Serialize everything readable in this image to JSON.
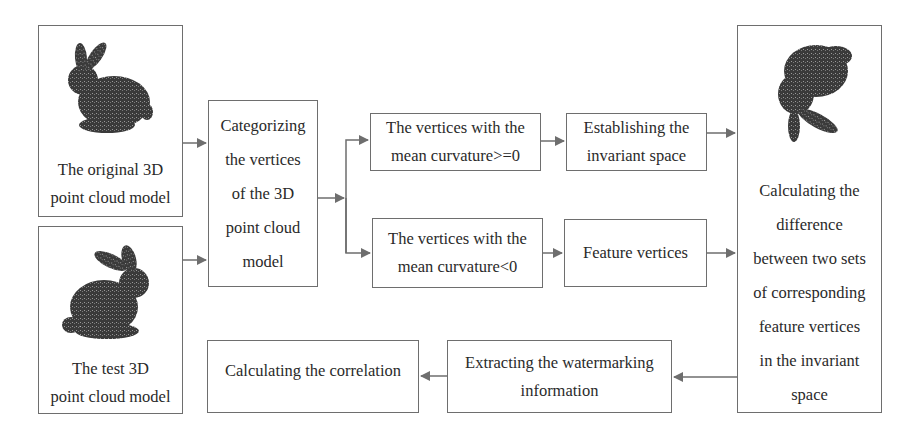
{
  "diagram": {
    "nodes": {
      "original": {
        "lines": [
          "The original  3D",
          "point cloud model"
        ],
        "image": "bunny-point-cloud"
      },
      "test": {
        "lines": [
          "The test 3D",
          "point cloud model"
        ],
        "image": "bunny-point-cloud"
      },
      "categorize": {
        "lines": [
          "Categorizing",
          "the vertices",
          "of the 3D",
          "point cloud",
          "model"
        ]
      },
      "positive": {
        "lines": [
          "The vertices with the",
          "mean curvature>=0"
        ]
      },
      "negative": {
        "lines": [
          "The vertices with the",
          "mean curvature<0"
        ]
      },
      "invariant": {
        "lines": [
          "Establishing the",
          "invariant space"
        ]
      },
      "feature": {
        "lines": [
          "Feature vertices"
        ]
      },
      "difference": {
        "lines": [
          "Calculating the",
          "difference",
          "between two sets",
          "of corresponding",
          "feature vertices",
          "in the invariant",
          "space"
        ],
        "image": "transformed-point-cloud"
      },
      "extract": {
        "lines": [
          "Extracting the watermarking",
          "information"
        ]
      },
      "correlation": {
        "lines": [
          "Calculating the correlation"
        ]
      }
    },
    "edges": [
      [
        "original",
        "categorize"
      ],
      [
        "test",
        "categorize"
      ],
      [
        "categorize",
        "positive"
      ],
      [
        "categorize",
        "negative"
      ],
      [
        "positive",
        "invariant"
      ],
      [
        "negative",
        "feature"
      ],
      [
        "invariant",
        "difference"
      ],
      [
        "feature",
        "difference"
      ],
      [
        "difference",
        "extract"
      ],
      [
        "extract",
        "correlation"
      ]
    ],
    "colors": {
      "stroke": "#6e6e6e",
      "text": "#2a2a2a",
      "cloud": "#3a3a3a"
    }
  }
}
